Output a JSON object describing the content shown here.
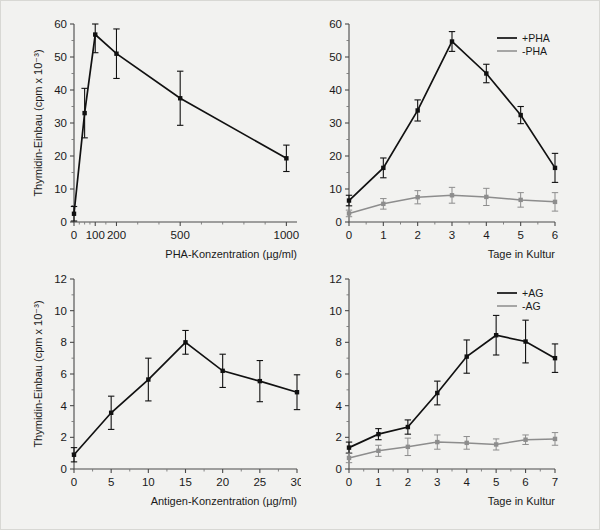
{
  "figure": {
    "title": "",
    "background_color": "#f2f2f0",
    "series_colors": {
      "primary": "#111111",
      "secondary": "#8d8d8d"
    }
  },
  "chart_data": [
    {
      "id": "top-left",
      "type": "line",
      "title": "",
      "xlabel": "PHA-Konzentration (µg/ml)",
      "ylabel": "Thymidin-Einbau (cpm x 10⁻³)",
      "xlim": [
        0,
        1050
      ],
      "ylim": [
        0,
        60
      ],
      "xticks": [
        0,
        100,
        200,
        500,
        1000
      ],
      "xtick_labels": [
        "0",
        "100",
        "200",
        "500",
        "1000"
      ],
      "yticks": [
        0,
        10,
        20,
        30,
        40,
        50,
        60
      ],
      "ytick_labels": [
        "0",
        "10",
        "20",
        "30",
        "40",
        "50",
        "60"
      ],
      "grid": false,
      "legend": null,
      "series": [
        {
          "name": "PHA",
          "color": "#111111",
          "x": [
            0,
            50,
            100,
            200,
            500,
            1000
          ],
          "values": [
            2.5,
            33.0,
            56.8,
            51.0,
            37.5,
            19.3
          ],
          "errors": [
            2.2,
            7.5,
            5.5,
            7.5,
            8.2,
            4.0
          ]
        }
      ]
    },
    {
      "id": "top-right",
      "type": "line",
      "title": "",
      "xlabel": "Tage in Kultur",
      "ylabel": "",
      "xlim": [
        0,
        6
      ],
      "ylim": [
        0,
        60
      ],
      "xticks": [
        0,
        1,
        2,
        3,
        4,
        5,
        6
      ],
      "xtick_labels": [
        "0",
        "1",
        "2",
        "3",
        "4",
        "5",
        "6"
      ],
      "yticks": [
        0,
        10,
        20,
        30,
        40,
        50,
        60
      ],
      "ytick_labels": [
        "0",
        "10",
        "20",
        "30",
        "40",
        "50",
        "60"
      ],
      "grid": false,
      "legend": {
        "position": "top-right",
        "entries": [
          "+PHA",
          "-PHA"
        ]
      },
      "series": [
        {
          "name": "+PHA",
          "color": "#111111",
          "x": [
            0,
            1,
            2,
            3,
            4,
            5,
            6
          ],
          "values": [
            6.5,
            16.4,
            33.8,
            54.7,
            45.0,
            32.4,
            16.4
          ],
          "errors": [
            1.6,
            3.0,
            3.2,
            3.0,
            2.8,
            2.6,
            4.4
          ]
        },
        {
          "name": "-PHA",
          "color": "#8d8d8d",
          "x": [
            0,
            1,
            2,
            3,
            4,
            5,
            6
          ],
          "values": [
            2.6,
            5.5,
            7.5,
            8.1,
            7.6,
            6.7,
            6.1
          ],
          "errors": [
            1.0,
            1.6,
            2.0,
            2.4,
            2.6,
            2.2,
            2.8
          ]
        }
      ]
    },
    {
      "id": "bottom-left",
      "type": "line",
      "title": "",
      "xlabel": "Antigen-Konzentration (µg/ml)",
      "ylabel": "Thymidin-Einbau (cpm x 10⁻³)",
      "xlim": [
        0,
        30
      ],
      "ylim": [
        0,
        12
      ],
      "xticks": [
        0,
        5,
        10,
        15,
        20,
        25,
        30
      ],
      "xtick_labels": [
        "0",
        "5",
        "10",
        "15",
        "20",
        "25",
        "30"
      ],
      "yticks": [
        0,
        2,
        4,
        6,
        8,
        10,
        12
      ],
      "ytick_labels": [
        "0",
        "2",
        "4",
        "6",
        "8",
        "10",
        "12"
      ],
      "grid": false,
      "legend": null,
      "series": [
        {
          "name": "Antigen",
          "color": "#111111",
          "x": [
            0,
            5,
            10,
            15,
            20,
            25,
            30
          ],
          "values": [
            0.9,
            3.55,
            5.65,
            8.0,
            6.2,
            5.55,
            4.85
          ],
          "errors": [
            0.45,
            1.05,
            1.35,
            0.75,
            1.05,
            1.3,
            1.1
          ]
        }
      ]
    },
    {
      "id": "bottom-right",
      "type": "line",
      "title": "",
      "xlabel": "Tage in Kultur",
      "ylabel": "",
      "xlim": [
        0,
        7
      ],
      "ylim": [
        0,
        12
      ],
      "xticks": [
        0,
        1,
        2,
        3,
        4,
        5,
        6,
        7
      ],
      "xtick_labels": [
        "0",
        "1",
        "2",
        "3",
        "4",
        "5",
        "6",
        "7"
      ],
      "yticks": [
        0,
        2,
        4,
        6,
        8,
        10,
        12
      ],
      "ytick_labels": [
        "0",
        "2",
        "4",
        "6",
        "8",
        "10",
        "12"
      ],
      "grid": false,
      "legend": {
        "position": "top-right",
        "entries": [
          "+AG",
          "-AG"
        ]
      },
      "series": [
        {
          "name": "+AG",
          "color": "#111111",
          "x": [
            0,
            1,
            2,
            3,
            4,
            5,
            6,
            7
          ],
          "values": [
            1.35,
            2.2,
            2.65,
            4.8,
            7.1,
            8.45,
            8.05,
            7.0
          ],
          "errors": [
            0.35,
            0.35,
            0.45,
            0.75,
            1.05,
            1.25,
            1.35,
            0.9
          ]
        },
        {
          "name": "-AG",
          "color": "#8d8d8d",
          "x": [
            0,
            1,
            2,
            3,
            4,
            5,
            6,
            7
          ],
          "values": [
            0.7,
            1.15,
            1.4,
            1.7,
            1.65,
            1.55,
            1.85,
            1.9
          ],
          "errors": [
            0.3,
            0.35,
            0.55,
            0.45,
            0.4,
            0.35,
            0.3,
            0.4
          ]
        }
      ]
    }
  ]
}
